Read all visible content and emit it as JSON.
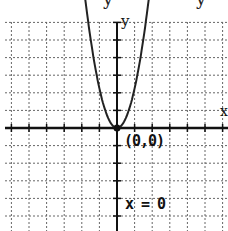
{
  "title_fragment": {
    "glyph_left": "y",
    "glyph_right": "y"
  },
  "graph": {
    "x_axis_label": "x",
    "y_axis_label": "y",
    "vertex_label": "(0,0)",
    "axis_of_symmetry_label": "x = 0",
    "colors": {
      "curve": "#222222",
      "axis": "#111111",
      "grid": "#555555",
      "background": "#ffffff"
    }
  },
  "chart_data": {
    "type": "line",
    "title": "",
    "function": "y = a x^2 (upward-opening parabola, vertex at origin)",
    "vertex": [
      0,
      0
    ],
    "axis_of_symmetry": "x = 0",
    "x": [
      -1.75,
      -1.5,
      -1,
      -0.5,
      0,
      0.5,
      1,
      1.5,
      1.75
    ],
    "series": [
      {
        "name": "parabola",
        "values": [
          7,
          5.1,
          2.3,
          0.57,
          0,
          0.57,
          2.3,
          5.1,
          7
        ]
      }
    ],
    "xlabel": "x",
    "ylabel": "y",
    "xlim": [
      -6.5,
      6.2
    ],
    "ylim": [
      -5.9,
      7.3
    ],
    "grid": true,
    "annotations": [
      "(0,0)",
      "x = 0"
    ]
  }
}
